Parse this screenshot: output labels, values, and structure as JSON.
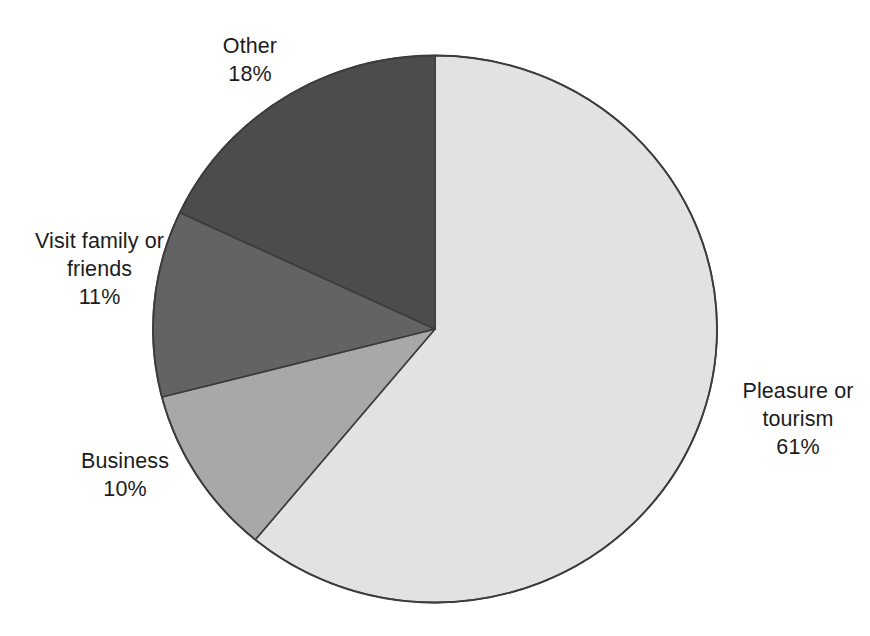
{
  "chart_data": {
    "type": "pie",
    "title": "",
    "subtitle": "",
    "xlabel": "",
    "ylabel": "",
    "legend_position": "none",
    "grid": false,
    "units": "percent",
    "total": 100,
    "start_angle_deg": 0,
    "direction": "clockwise",
    "categories": [
      "Pleasure or tourism",
      "Business",
      "Visit family or friends",
      "Other"
    ],
    "values": [
      61,
      10,
      11,
      18
    ],
    "slices": [
      {
        "label": "Pleasure or tourism",
        "label_lines": [
          "Pleasure or",
          "tourism"
        ],
        "value": 61,
        "value_text": "61%",
        "color": "#e2e2e2",
        "start_deg": 0,
        "end_deg": 219.6
      },
      {
        "label": "Business",
        "label_lines": [
          "Business"
        ],
        "value": 10,
        "value_text": "10%",
        "color": "#a8a8a8",
        "start_deg": 219.6,
        "end_deg": 255.6
      },
      {
        "label": "Visit family or friends",
        "label_lines": [
          "Visit family or",
          "friends"
        ],
        "value": 11,
        "value_text": "11%",
        "color": "#636363",
        "start_deg": 255.6,
        "end_deg": 295.2
      },
      {
        "label": "Other",
        "label_lines": [
          "Other"
        ],
        "value": 18,
        "value_text": "18%",
        "color": "#4c4c4c",
        "start_deg": 295.2,
        "end_deg": 360
      }
    ],
    "outline_color": "#3c3c3c",
    "background_color": "#ffffff"
  },
  "labels": {
    "other": {
      "line1": "Other",
      "line2": "18%"
    },
    "visit": {
      "line1": "Visit family or",
      "line2": "friends",
      "line3": "11%"
    },
    "business": {
      "line1": "Business",
      "line2": "10%"
    },
    "pleasure": {
      "line1": "Pleasure or",
      "line2": "tourism",
      "line3": "61%"
    }
  }
}
